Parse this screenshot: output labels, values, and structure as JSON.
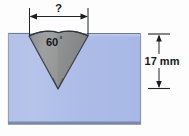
{
  "figure": {
    "background_color": "#fdfdfd"
  },
  "dimensions": {
    "width_label": "?",
    "depth_label": "17 mm",
    "angle_value": "60",
    "angle_unit": "°"
  },
  "geometry": {
    "block": {
      "left": 8,
      "right": 141,
      "top": 33,
      "bottom": 124,
      "fill": "#adbde8",
      "stroke": "#6f7f9e"
    },
    "groove": {
      "left_lip_x": 29,
      "right_lip_x": 88,
      "apex_x": 58,
      "apex_y": 89,
      "fill": "#8d8f8e",
      "stroke": "#3d4246"
    },
    "top_dim_line": {
      "y": 17,
      "x_start": 29,
      "x_end": 88
    },
    "right_dim_line": {
      "x": 159,
      "y_start": 34,
      "y_end": 88
    }
  },
  "colors": {
    "block_fill": "#adbde8",
    "block_fill_light": "#c3cfee",
    "block_edge": "#717f9c",
    "block_bottom_edge": "#7b88a5",
    "groove_fill": "#8f918f",
    "groove_fill_light": "#a3a5a3",
    "groove_edge": "#3a3f44",
    "dim_line": "#1a1d21",
    "text": "#15181c"
  },
  "labels": {
    "width_question": "?",
    "depth": "17 mm",
    "angle": "60°"
  }
}
